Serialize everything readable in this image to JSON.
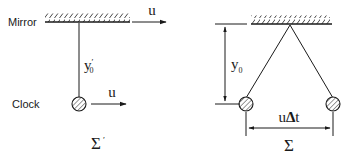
{
  "figure": {
    "background_color": "#ffffff",
    "ink_color": "#1a1a1a",
    "width": 346,
    "height": 160
  },
  "left_panel": {
    "frame_label": "Σ ′",
    "frame_label_base": "Σ",
    "frame_label_prime": "′",
    "mirror_label": "Mirror",
    "clock_label": "Clock",
    "height_label_base": "y",
    "height_label_sub": "0",
    "height_label_prime": "′",
    "velocity_label_top": "u",
    "velocity_label_bottom": "u",
    "mirror": {
      "x1": 45,
      "x2": 130,
      "y": 22
    },
    "rod": {
      "x": 79,
      "y1": 24,
      "y2": 100
    },
    "clock_ball": {
      "cx": 79,
      "cy": 104,
      "r": 7
    },
    "arrow_top": {
      "x1": 132,
      "x2": 168,
      "y": 22
    },
    "arrow_bottom": {
      "x1": 92,
      "x2": 128,
      "y": 104
    }
  },
  "right_panel": {
    "frame_label": "Σ",
    "height_label_base": "y",
    "height_label_sub": "0",
    "displacement_label_u": "u",
    "displacement_label_delta": "Δ",
    "displacement_label_t": "t",
    "displacement_label": "uΔt",
    "mirror": {
      "x1": 251,
      "x2": 330,
      "y": 24
    },
    "apex": {
      "x": 290,
      "y": 26
    },
    "ball_left": {
      "cx": 246,
      "cy": 104,
      "r": 7
    },
    "ball_right": {
      "cx": 333,
      "cy": 104,
      "r": 7
    },
    "dim_vertical": {
      "x": 225,
      "y1": 26,
      "y2": 104
    },
    "dim_horizontal": {
      "y": 128,
      "x1": 246,
      "x2": 333
    }
  },
  "icons": {
    "hatched-mirror-icon": "hatched-mirror",
    "hatched-ball-icon": "hatched-circle",
    "arrow-right-icon": "arrow-right",
    "dimension-double-arrow-icon": "double-arrow"
  }
}
